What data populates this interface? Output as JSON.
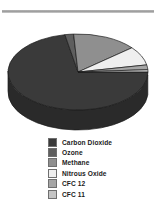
{
  "figure": {
    "background_color": "#ffffff",
    "rule_color": "#9a9a9a"
  },
  "legend": {
    "name": "chart-legend",
    "entries": [
      {
        "label": "Carbon Dioxide",
        "color": "#3a3a3a"
      },
      {
        "label": "Ozone",
        "color": "#5e5e5e"
      },
      {
        "label": "Methane",
        "color": "#8f8f8f"
      },
      {
        "label": "Nitrous Oxide",
        "color": "#efefef"
      },
      {
        "label": "CFC 12",
        "color": "#a6a6a6"
      },
      {
        "label": "CFC 11",
        "color": "#c4c4c4"
      }
    ]
  },
  "chart_data": {
    "type": "pie",
    "title": "",
    "subtitle": "",
    "xlabel": "",
    "ylabel": "",
    "three_d": true,
    "grid": false,
    "legend_position": "bottom",
    "start_angle_deg": 0,
    "direction": "clockwise",
    "categories": [
      "Carbon Dioxide",
      "Ozone",
      "Methane",
      "Nitrous Oxide",
      "CFC 12",
      "CFC 11"
    ],
    "values": [
      72,
      2,
      15,
      8,
      2,
      1
    ],
    "units": "percent",
    "colors": [
      "#3a3a3a",
      "#5e5e5e",
      "#8f8f8f",
      "#efefef",
      "#a6a6a6",
      "#c4c4c4"
    ],
    "series": [
      {
        "name": "Greenhouse gas contribution",
        "values": [
          72,
          2,
          15,
          8,
          2,
          1
        ]
      }
    ],
    "annotations": []
  }
}
